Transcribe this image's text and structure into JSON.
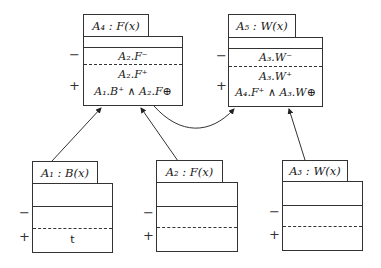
{
  "diagram": {
    "nodes": [
      {
        "id": "A4",
        "label": "A₄ : F(x)",
        "negative_cell": [
          "A₂.F⁻"
        ],
        "positive_cell": [
          "A₂.F⁺",
          "A₁.B⁺ ∧ A₂.F^⊕"
        ]
      },
      {
        "id": "A5",
        "label": "A₅ : W(x)",
        "negative_cell": [
          "A₃.W⁻"
        ],
        "positive_cell": [
          "A₃.W⁺",
          "A₄.F⁺ ∧ A₃.W^⊕"
        ]
      },
      {
        "id": "A1",
        "label": "A₁ : B(x)",
        "negative_cell": [],
        "positive_cell": [
          "t"
        ]
      },
      {
        "id": "A2",
        "label": "A₂ : F(x)",
        "negative_cell": [],
        "positive_cell": []
      },
      {
        "id": "A3",
        "label": "A₃ : W(x)",
        "negative_cell": [],
        "positive_cell": []
      }
    ],
    "edges": [
      {
        "from": "A1",
        "to": "A4",
        "style": "straight"
      },
      {
        "from": "A2",
        "to": "A4",
        "style": "straight"
      },
      {
        "from": "A4",
        "to": "A5",
        "style": "curved"
      },
      {
        "from": "A3",
        "to": "A5",
        "style": "straight"
      }
    ],
    "signs": {
      "minus": "−",
      "plus": "+"
    }
  },
  "text": {
    "a4_label": "A₄ : F(x)",
    "a4_neg_1": "A₂.F⁻",
    "a4_pos_1": "A₂.F⁺",
    "a4_pos_2": "A₁.B⁺ ∧ A₂.F⊕",
    "a5_label": "A₅ : W(x)",
    "a5_neg_1": "A₃.W⁻",
    "a5_pos_1": "A₃.W⁺",
    "a5_pos_2": "A₄.F⁺ ∧ A₃.W⊕",
    "a1_label": "A₁ : B(x)",
    "a1_pos_1": "t",
    "a2_label": "A₂ : F(x)",
    "a3_label": "A₃ : W(x)",
    "minus": "−",
    "plus": "+"
  }
}
